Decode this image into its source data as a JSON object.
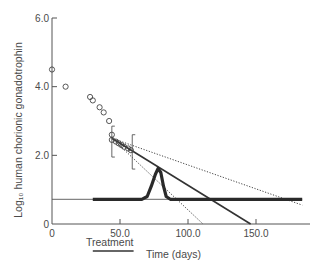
{
  "chart_data": {
    "type": "scatter",
    "title": "",
    "xlabel": "Time (days)",
    "ylabel": "Log₁₀ human chorionic gonadotrophin",
    "xlim": [
      0,
      190
    ],
    "ylim": [
      0,
      6.0
    ],
    "grid": false,
    "x_ticks": [
      {
        "value": 0,
        "label": "0"
      },
      {
        "value": 50,
        "label": "50.0"
      },
      {
        "value": 100,
        "label": "100.0"
      },
      {
        "value": 150,
        "label": "150.0"
      }
    ],
    "y_ticks": [
      {
        "value": 0,
        "label": "0"
      },
      {
        "value": 2,
        "label": "2.0"
      },
      {
        "value": 4,
        "label": "4.0"
      },
      {
        "value": 6,
        "label": "6.0"
      }
    ],
    "annotation": {
      "text": "Treatment",
      "x_start": 30,
      "x_end": 60
    },
    "series": [
      {
        "name": "hCG measurements",
        "style": "open-circle",
        "points": [
          [
            0,
            4.5
          ],
          [
            10,
            4.0
          ],
          [
            28,
            3.7
          ],
          [
            30,
            3.6
          ],
          [
            35,
            3.4
          ],
          [
            38,
            3.25
          ],
          [
            42,
            3.0
          ],
          [
            44,
            2.6
          ],
          [
            44,
            2.45
          ],
          [
            47,
            2.4
          ],
          [
            49,
            2.35
          ],
          [
            51,
            2.3
          ],
          [
            53,
            2.25
          ],
          [
            56,
            2.2
          ],
          [
            58,
            2.15
          ]
        ]
      },
      {
        "name": "Regression line",
        "style": "solid",
        "points": [
          [
            44,
            2.5
          ],
          [
            146,
            0
          ]
        ]
      },
      {
        "name": "Upper confidence limit",
        "style": "dotted",
        "points": [
          [
            44,
            2.5
          ],
          [
            184,
            0.55
          ]
        ]
      },
      {
        "name": "Lower confidence limit",
        "style": "dotted",
        "points": [
          [
            44,
            2.5
          ],
          [
            111,
            0
          ]
        ]
      },
      {
        "name": "Threshold level",
        "style": "thin-solid",
        "points": [
          [
            0,
            0.72
          ],
          [
            184,
            0.72
          ]
        ]
      },
      {
        "name": "Response curve",
        "style": "thick-solid",
        "points": [
          [
            30,
            0.72
          ],
          [
            66,
            0.72
          ],
          [
            70,
            0.8
          ],
          [
            73,
            1.1
          ],
          [
            76,
            1.45
          ],
          [
            78,
            1.62
          ],
          [
            80,
            1.5
          ],
          [
            82,
            1.1
          ],
          [
            84,
            0.8
          ],
          [
            87,
            0.72
          ],
          [
            184,
            0.72
          ]
        ]
      }
    ],
    "error_bars": [
      {
        "x": 44,
        "y_low": 1.95,
        "y_high": 2.85
      },
      {
        "x": 59,
        "y_low": 1.6,
        "y_high": 2.6
      }
    ]
  }
}
